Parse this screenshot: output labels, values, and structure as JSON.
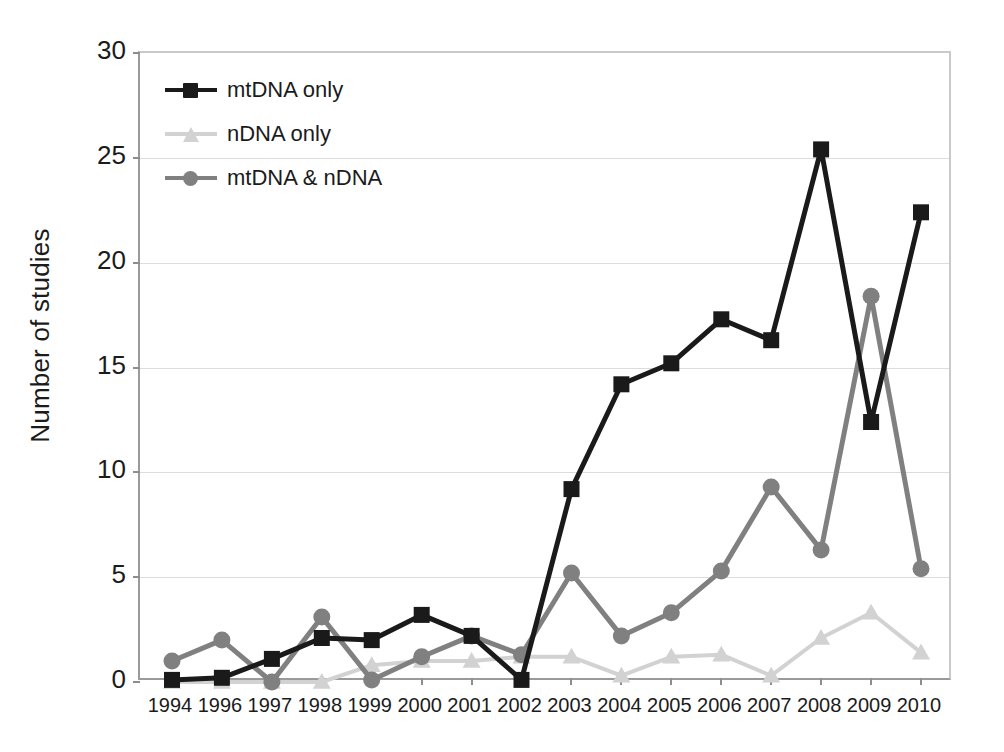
{
  "chart_data": {
    "type": "line",
    "title": "",
    "xlabel": "",
    "ylabel": "Number of studies",
    "categories": [
      "1994",
      "1996",
      "1997",
      "1998",
      "1999",
      "2000",
      "2001",
      "2002",
      "2003",
      "2004",
      "2005",
      "2006",
      "2007",
      "2008",
      "2009",
      "2010"
    ],
    "ylim": [
      0,
      30
    ],
    "yticks": [
      0,
      5,
      10,
      15,
      20,
      25,
      30
    ],
    "grid": true,
    "legend_position": "top-left",
    "series": [
      {
        "name": "mtDNA only",
        "color": "#1a1a1a",
        "marker": "square",
        "values": [
          0.1,
          0.2,
          1.1,
          2.1,
          2.0,
          3.2,
          2.2,
          0.1,
          9.2,
          14.2,
          15.2,
          17.3,
          16.3,
          25.4,
          12.4,
          22.4
        ]
      },
      {
        "name": "nDNA only",
        "color": "#d2d2d2",
        "marker": "triangle",
        "values": [
          0.0,
          0.0,
          0.0,
          0.0,
          0.8,
          1.0,
          1.0,
          1.2,
          1.2,
          0.3,
          1.2,
          1.3,
          0.3,
          2.1,
          3.3,
          1.4
        ]
      },
      {
        "name": "mtDNA & nDNA",
        "color": "#808080",
        "marker": "circle",
        "values": [
          1.0,
          2.0,
          0.0,
          3.1,
          0.1,
          1.2,
          2.2,
          1.3,
          5.2,
          2.2,
          3.3,
          5.3,
          9.3,
          6.3,
          18.4,
          5.4
        ]
      }
    ]
  },
  "axis": {
    "y_tick_labels": [
      "30",
      "25",
      "20",
      "15",
      "10",
      "5",
      "0"
    ],
    "y_title": "Number of studies"
  },
  "legend": {
    "items": [
      {
        "label": "mtDNA only"
      },
      {
        "label": "nDNA only"
      },
      {
        "label": "mtDNA & nDNA"
      }
    ]
  },
  "colors": {
    "mtdna_only": "#1a1a1a",
    "ndna_only": "#d2d2d2",
    "mtdna_and_ndna": "#808080",
    "gridline": "#dcdcdc",
    "axis": "#9a9a9a",
    "background": "#ffffff"
  }
}
